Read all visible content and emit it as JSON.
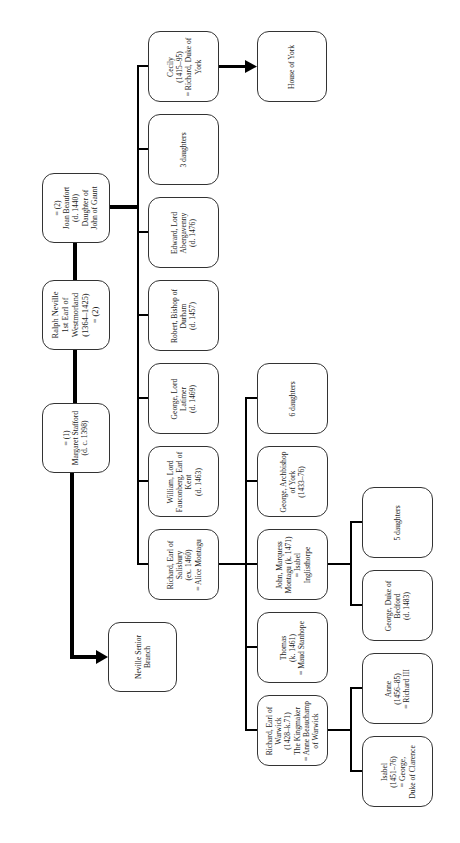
{
  "diagram": {
    "orientation": "rotated-90-ccw",
    "line_color": "#000000",
    "box_border_color": "#333333"
  },
  "nodes": {
    "joan": {
      "label": "= (2)\nJoan Beaufort\n(d. 1440)\nDaughter of\nJohn of Gaunt"
    },
    "ralph": {
      "label": "Ralph Neville\n1st Earl of\nWestmorland\n(1364–1425)\n= (2)"
    },
    "margaret": {
      "label": "= (1)\nMargaret Stafford\n(d. c. 1398)"
    },
    "senior_branch": {
      "label": "Neville Senior\nBranch"
    },
    "house_of_york": {
      "label": "House of York"
    },
    "cecily": {
      "label": "Cecily\n(1415–95)\n= Richard, Duke of\nYork"
    },
    "three_daughters": {
      "label": "3 daughters"
    },
    "edward": {
      "label": "Edward, Lord\nAbergavenny\n(d. 1476)"
    },
    "robert": {
      "label": "Robert, Bishop of\nDurham\n(d. 1457)"
    },
    "george_latimer": {
      "label": "George, Lord\nLatimer\n(d. 1469)"
    },
    "william": {
      "label": "William, Lord\nFauconberg, Earl of\nKent\n(d. 1463)"
    },
    "richard_salisbury": {
      "label": "Richard, Earl of\nSalisbury\n(ex. 1460)\n= Alice Montagu"
    },
    "six_daughters": {
      "label": "6 daughters"
    },
    "george_archbishop": {
      "label": "George, Archbishop\nof York\n(1433–76)"
    },
    "john_marquess": {
      "label": "John, Marquess\nMontagu (k. 1471)\n= Isabel\nInglisthorpe"
    },
    "thomas": {
      "label": "Thomas\n(k. 1461)\n= Maud Stanhope"
    },
    "richard_warwick": {
      "label": "Richard, Earl of\nWarwick\n(1428–k.71)\nThe Kingmaker\n= Anne Beauchamp\nof Warwick"
    },
    "five_daughters": {
      "label": "5 daughters"
    },
    "george_bedford": {
      "label": "George, Duke of\nBedford\n(d. 1483)"
    },
    "anne": {
      "label": "Anne\n(1456–85)\n= Richard III"
    },
    "isabel": {
      "label": "Isabel\n(1451–76)\n= George,\nDuke of Clarence"
    }
  }
}
